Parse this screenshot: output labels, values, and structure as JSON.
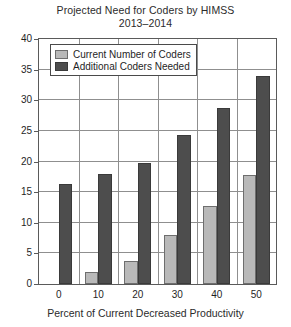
{
  "chart_data": {
    "type": "bar",
    "title": "Projected Need for Coders by HIMSS 2013–2014",
    "title_line1": "Projected Need for Coders by HIMSS",
    "title_line2": "2013–2014",
    "xlabel": "Percent of Current Decreased Productivity",
    "ylabel": "",
    "categories": [
      "0",
      "10",
      "20",
      "30",
      "40",
      "50"
    ],
    "xtick_labels": [
      "0",
      "10",
      "20",
      "30",
      "40",
      "50"
    ],
    "ytick_labels": [
      "0",
      "5",
      "10",
      "15",
      "20",
      "25",
      "30",
      "35",
      "40"
    ],
    "ylim": [
      0,
      40
    ],
    "ytick_step": 5,
    "grid": "horizontal-and-vertical",
    "legend_position": "top-left-inside",
    "series": [
      {
        "name": "Current Number of Coders",
        "color": "#b9b9b9",
        "values": [
          0,
          2.0,
          3.7,
          8.0,
          12.7,
          17.8
        ]
      },
      {
        "name": "Additional Coders Needed",
        "color": "#4d4d4d",
        "values": [
          16.3,
          18.0,
          19.7,
          24.3,
          28.8,
          34.0
        ]
      }
    ]
  },
  "legend": {
    "items": [
      {
        "label": "Current Number of Coders",
        "swatch": "light"
      },
      {
        "label": "Additional Coders Needed",
        "swatch": "dark"
      }
    ]
  }
}
